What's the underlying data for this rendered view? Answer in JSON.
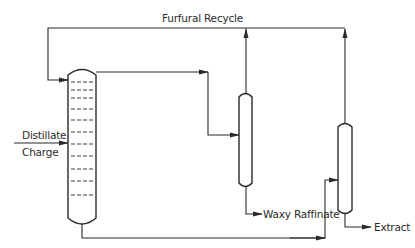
{
  "diagram": {
    "labels": {
      "recycle": "Furfural Recycle",
      "feed_line1": "Distillate",
      "feed_line2": "Charge",
      "raffinate": "Waxy Raffinate",
      "extract": "Extract"
    },
    "components": [
      {
        "id": "extraction-tower",
        "type": "column",
        "trays": 12
      },
      {
        "id": "raffinate-recovery",
        "type": "column"
      },
      {
        "id": "extract-recovery",
        "type": "column"
      }
    ],
    "colors": {
      "line": "#2a2a2a",
      "background": "#ffffff"
    }
  }
}
